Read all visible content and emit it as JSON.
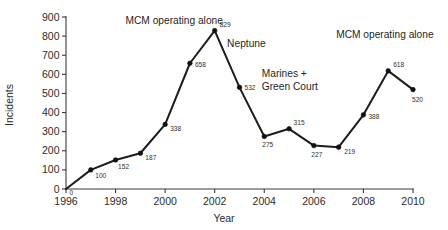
{
  "chart_data": {
    "type": "line",
    "title": "",
    "xlabel": "Year",
    "ylabel": "Incidents",
    "xlim": [
      1996,
      2010
    ],
    "ylim": [
      0,
      900
    ],
    "ytick_step": 100,
    "xtick_step": 2,
    "grid": false,
    "legend": "none",
    "x": [
      1996,
      1997,
      1998,
      1999,
      2000,
      2001,
      2002,
      2003,
      2004,
      2005,
      2006,
      2007,
      2008,
      2009,
      2010
    ],
    "values": [
      0,
      100,
      152,
      187,
      338,
      658,
      829,
      532,
      275,
      315,
      227,
      219,
      388,
      618,
      520
    ],
    "point_labels": [
      "0",
      "100",
      "152",
      "187",
      "338",
      "658",
      "829",
      "532",
      "275",
      "315",
      "227",
      "219",
      "388",
      "618",
      "520"
    ],
    "series": [
      {
        "name": "Incidents",
        "values": [
          0,
          100,
          152,
          187,
          338,
          658,
          829,
          532,
          275,
          315,
          227,
          219,
          388,
          618,
          520
        ],
        "color": "#1c1c1c",
        "marker": "filled-circle"
      }
    ],
    "ytick_labels": [
      "0",
      "100",
      "200",
      "300",
      "400",
      "500",
      "600",
      "700",
      "800",
      "900"
    ],
    "xtick_labels": [
      "1996",
      "1998",
      "2000",
      "2002",
      "2004",
      "2006",
      "2008",
      "2010"
    ],
    "annotations": [
      {
        "text": "MCM operating alone",
        "x": 1998.4,
        "y": 862,
        "align": "start"
      },
      {
        "text": "Neptune",
        "x": 2002.5,
        "y": 745,
        "align": "start"
      },
      {
        "text": "Marines +",
        "x": 2003.9,
        "y": 585,
        "align": "start"
      },
      {
        "text": "Green Court",
        "x": 2003.9,
        "y": 520,
        "align": "start"
      },
      {
        "text": "MCM operating alone",
        "x": 2006.9,
        "y": 790,
        "align": "start"
      }
    ]
  }
}
